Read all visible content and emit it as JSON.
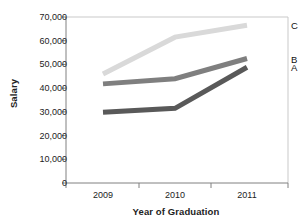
{
  "chart_data": {
    "type": "line",
    "title": "",
    "xlabel": "Year of Graduation",
    "ylabel": "Salary",
    "categories": [
      "2009",
      "2010",
      "2011"
    ],
    "x": [
      2009,
      2010,
      2011
    ],
    "xlim": [
      2008.6,
      2011.4
    ],
    "ylim": [
      0,
      70000
    ],
    "yticks": [
      0,
      10000,
      20000,
      30000,
      40000,
      50000,
      60000,
      70000
    ],
    "ytick_labels": [
      "0",
      "10,000",
      "20,000",
      "30,000",
      "40,000",
      "50,000",
      "60,000",
      "70,000"
    ],
    "grid": false,
    "legend_position": "right-inline-labels",
    "series": [
      {
        "name": "C",
        "values": [
          46000,
          61500,
          66500
        ],
        "color": "#d9d9d9"
      },
      {
        "name": "B",
        "values": [
          41800,
          44000,
          52500
        ],
        "color": "#7f7f7f"
      },
      {
        "name": "A",
        "values": [
          29800,
          31500,
          48800
        ],
        "color": "#595959"
      }
    ]
  },
  "axes": {
    "y_title": "Salary",
    "x_title": "Year of Graduation",
    "axis_color": "#808080"
  },
  "labels": {
    "series_c": "C",
    "series_b": "B",
    "series_a": "A"
  }
}
